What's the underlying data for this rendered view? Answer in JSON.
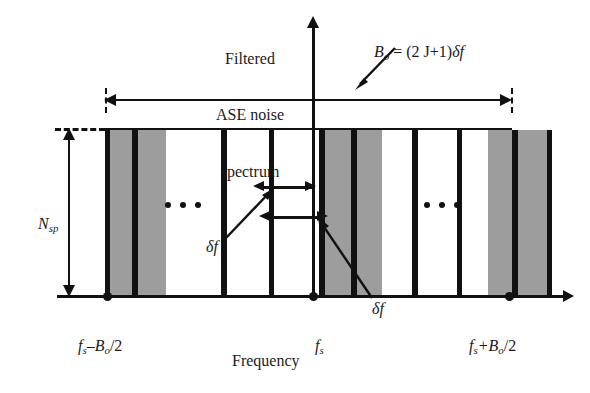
{
  "figure": {
    "title_text": "Filtered ASE noise spectrum",
    "caption_line1": "Filtered",
    "caption_line2": "ASE noise",
    "caption_line3": "spectrum",
    "xaxis_label": "Frequency",
    "yaxis_label": "N",
    "yaxis_label_sub": "sp",
    "bandwidth_label": "B",
    "bandwidth_label_sub": "o",
    "bandwidth_formula": " = (2 J+1)",
    "bandwidth_formula_delta": "δf",
    "left_tick_label_f": "f",
    "left_tick_label_fsub": "s",
    "left_tick_label_rest": "–B",
    "left_tick_label_bsub": "o",
    "left_tick_label_tail": "/2",
    "center_tick_label_f": "f",
    "center_tick_label_fsub": "s",
    "right_tick_label_f": "f",
    "right_tick_label_fsub": "s",
    "right_tick_label_rest": "+B",
    "right_tick_label_bsub": "o",
    "right_tick_label_tail": "/2",
    "delta_label_left": "δf",
    "delta_label_right": "δf",
    "ellipsis_dot": "•"
  },
  "colors": {
    "ink": "#111111",
    "band_gray": "#9d9d9d",
    "band_white": "#ffffff",
    "background": "#ffffff"
  },
  "chart_data": {
    "type": "bar",
    "title": "Filtered ASE noise spectrum",
    "xlabel": "Frequency",
    "ylabel": "N_sp",
    "xlim_labels": [
      "f_s-B_o/2",
      "f_s",
      "f_s+B_o/2"
    ],
    "ylim_labels": [
      "0",
      "N_sp"
    ],
    "slot_width": "df",
    "total_bandwidth": "B_o = (2J+1)df",
    "spectral_density": "N_sp",
    "grid": false,
    "legend": null,
    "bands": [
      {
        "x": 0,
        "w": 5,
        "fill": "black"
      },
      {
        "x": 5,
        "w": 22,
        "fill": "gray"
      },
      {
        "x": 27,
        "w": 6,
        "fill": "black"
      },
      {
        "x": 33,
        "w": 28,
        "fill": "gray"
      },
      {
        "x": 61,
        "w": 55,
        "fill": "white"
      },
      {
        "x": 116,
        "w": 6,
        "fill": "black"
      },
      {
        "x": 122,
        "w": 42,
        "fill": "white"
      },
      {
        "x": 164,
        "w": 5,
        "fill": "black"
      },
      {
        "x": 169,
        "w": 45,
        "fill": "white"
      },
      {
        "x": 214,
        "w": 6,
        "fill": "black"
      },
      {
        "x": 220,
        "w": 26,
        "fill": "gray"
      },
      {
        "x": 246,
        "w": 6,
        "fill": "black"
      },
      {
        "x": 252,
        "w": 25,
        "fill": "gray"
      },
      {
        "x": 277,
        "w": 30,
        "fill": "white"
      },
      {
        "x": 307,
        "w": 6,
        "fill": "black"
      },
      {
        "x": 313,
        "w": 39,
        "fill": "white"
      },
      {
        "x": 352,
        "w": 5,
        "fill": "black"
      },
      {
        "x": 357,
        "w": 26,
        "fill": "white"
      },
      {
        "x": 383,
        "w": 24,
        "fill": "gray"
      },
      {
        "x": 407,
        "w": 6,
        "fill": "black"
      },
      {
        "x": 413,
        "w": 29,
        "fill": "gray"
      },
      {
        "x": 442,
        "w": 5,
        "fill": "black"
      }
    ]
  }
}
